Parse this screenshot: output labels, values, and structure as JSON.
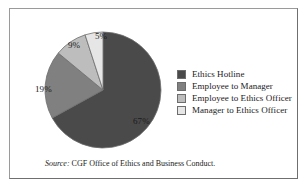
{
  "figure": {
    "border_color": "#9a9a9a",
    "background": "#ffffff"
  },
  "chart_data": {
    "type": "pie",
    "title": "",
    "subtitle": "",
    "xlabel": "",
    "ylabel": "",
    "legend_position": "right",
    "grid": false,
    "units": "percent",
    "start_angle_deg": 0,
    "direction": "clockwise",
    "categories": [
      "Ethics Hotline",
      "Employee to Manager",
      "Employee to Ethics Officer",
      "Manager to Ethics Officer"
    ],
    "values": [
      67,
      19,
      9,
      5
    ],
    "data_labels": [
      "67%",
      "19%",
      "9%",
      "5%"
    ],
    "colors": [
      "#4a4a4a",
      "#808080",
      "#bdbdbd",
      "#e6e6e6"
    ],
    "slices": [
      {
        "label": "Ethics Hotline",
        "value": 67,
        "data_label": "67%",
        "color": "#4a4a4a"
      },
      {
        "label": "Employee to Manager",
        "value": 19,
        "data_label": "19%",
        "color": "#808080"
      },
      {
        "label": "Employee to Ethics Officer",
        "value": 9,
        "data_label": "9%",
        "color": "#bdbdbd"
      },
      {
        "label": "Manager to Ethics Officer",
        "value": 5,
        "data_label": "5%",
        "color": "#e6e6e6"
      }
    ]
  },
  "legend": {
    "items": [
      {
        "label": "Ethics Hotline",
        "color": "#4a4a4a"
      },
      {
        "label": "Employee to Manager",
        "color": "#808080"
      },
      {
        "label": "Employee to Ethics Officer",
        "color": "#bdbdbd"
      },
      {
        "label": "Manager to Ethics Officer",
        "color": "#e6e6e6"
      }
    ]
  },
  "source": {
    "prefix": "Source:",
    "text": "CGF Office of Ethics and Business Conduct."
  }
}
